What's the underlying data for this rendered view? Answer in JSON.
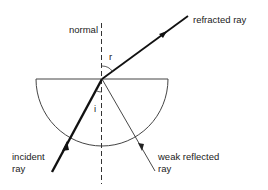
{
  "diagram": {
    "labels": {
      "normal": "normal",
      "refracted_ray": "refracted ray",
      "incident_ray_line1": "incident",
      "incident_ray_line2": "ray",
      "weak_reflected_line1": "weak reflected",
      "weak_reflected_line2": "ray",
      "angle_refraction": "r",
      "angle_incidence": "i"
    },
    "colors": {
      "stroke": "#1a1a1a",
      "block_outline": "#444444",
      "background": "#ffffff"
    }
  }
}
